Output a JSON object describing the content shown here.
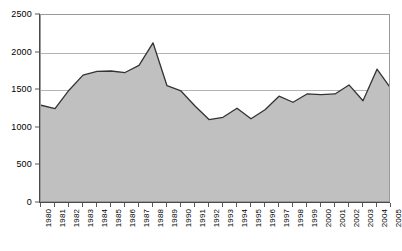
{
  "chart_data": {
    "type": "area",
    "title": "",
    "subtitle": "",
    "xlabel": "",
    "ylabel": "",
    "legend": [],
    "legend_position": "none",
    "grid": true,
    "ylim": [
      0,
      2500
    ],
    "yticks": [
      0,
      500,
      1000,
      1500,
      2000,
      2500
    ],
    "ytick_labels": [
      "0",
      "500",
      "1000",
      "1500",
      "2000",
      "2500"
    ],
    "categories": [
      "1980",
      "1981",
      "1982",
      "1983",
      "1984",
      "1985",
      "1986",
      "1987",
      "1988",
      "1989",
      "1990",
      "1991",
      "1992",
      "1993",
      "1994",
      "1995",
      "1996",
      "1997",
      "1998",
      "1999",
      "2000",
      "2001",
      "2002",
      "2003",
      "2004",
      "2005"
    ],
    "values": [
      1300,
      1255,
      1500,
      1700,
      1750,
      1755,
      1735,
      1830,
      2130,
      1560,
      1490,
      1290,
      1110,
      1140,
      1260,
      1120,
      1240,
      1420,
      1340,
      1450,
      1440,
      1450,
      1570,
      1360,
      1780,
      1520
    ],
    "series": [
      {
        "name": "series-1",
        "values": [
          1300,
          1255,
          1500,
          1700,
          1750,
          1755,
          1735,
          1830,
          2130,
          1560,
          1490,
          1290,
          1110,
          1140,
          1260,
          1120,
          1240,
          1420,
          1340,
          1450,
          1440,
          1450,
          1570,
          1360,
          1780,
          1520
        ],
        "fill_color": "#c0c0c0",
        "line_color": "#333333"
      }
    ],
    "colors": {
      "area_fill": "#c0c0c0",
      "line": "#333333",
      "gridline": "#b4b4b4",
      "axis": "#4a4a4a",
      "plot_background": "#ffffff",
      "page_background": "#ffffff",
      "text": "#000000"
    }
  }
}
